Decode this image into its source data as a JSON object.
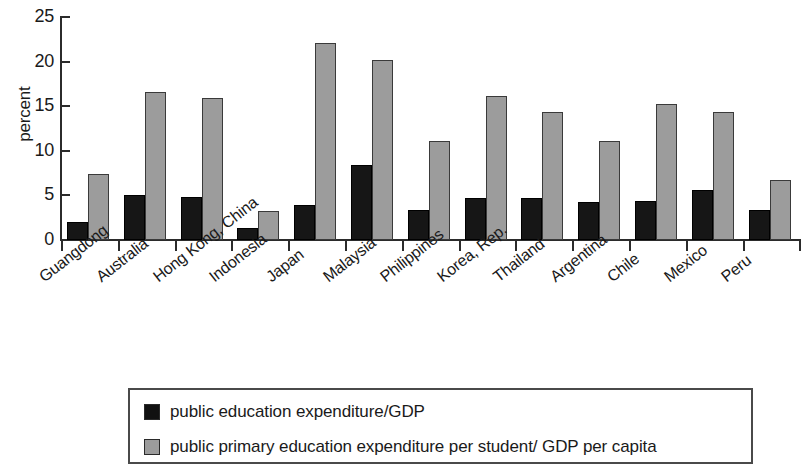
{
  "chart_data": {
    "type": "bar",
    "title": "",
    "subtitle": "",
    "xlabel": "",
    "ylabel": "percent",
    "ylim": [
      0,
      25
    ],
    "yticks": [
      0,
      5,
      10,
      15,
      20,
      25
    ],
    "grid": false,
    "legend_position": "bottom",
    "categories": [
      "Guangdong",
      "Australia",
      "Hong Kong, China",
      "Indonesia",
      "Japan",
      "Malaysia",
      "Philippines",
      "Korea, Rep.",
      "Thailand",
      "Argentina",
      "Chile",
      "Mexico",
      "Peru"
    ],
    "series": [
      {
        "name": "public education expenditure/GDP",
        "color": "#161616",
        "values": [
          2.0,
          5.1,
          4.8,
          1.4,
          3.9,
          8.4,
          3.4,
          4.7,
          4.7,
          4.3,
          4.4,
          5.6,
          3.4
        ]
      },
      {
        "name": "public primary education expenditure per student/ GDP per capita",
        "color": "#9c9c9c",
        "values": [
          7.4,
          16.6,
          15.9,
          3.3,
          22.1,
          20.2,
          11.1,
          16.1,
          14.3,
          11.1,
          15.3,
          14.3,
          6.7
        ]
      }
    ]
  },
  "legend": {
    "items": [
      {
        "label": "public education expenditure/GDP",
        "swatch": "series-dark"
      },
      {
        "label": "public primary education expenditure per student/ GDP per capita",
        "swatch": "series-light"
      }
    ]
  }
}
